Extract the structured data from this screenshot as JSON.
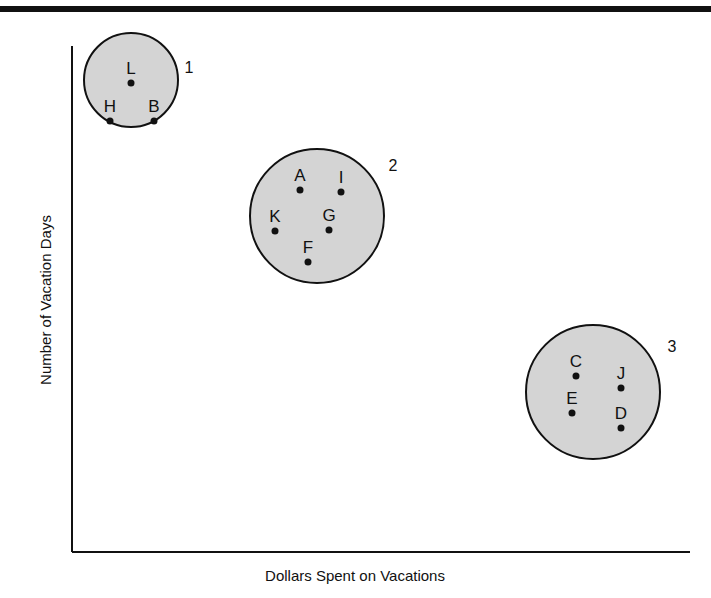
{
  "chart_data": {
    "type": "scatter",
    "title": "",
    "xlabel": "Dollars Spent on Vacations",
    "ylabel": "Number of Vacation Days",
    "grid": false,
    "legend": null,
    "clusters": [
      {
        "id": "1",
        "label": "1",
        "cx": 131,
        "cy": 80,
        "r": 47,
        "label_pos": [
          189,
          73
        ],
        "points": [
          {
            "name": "L",
            "x": 131,
            "y": 83
          },
          {
            "name": "H",
            "x": 110,
            "y": 121
          },
          {
            "name": "B",
            "x": 154,
            "y": 121
          }
        ]
      },
      {
        "id": "2",
        "label": "2",
        "cx": 317,
        "cy": 216,
        "r": 67,
        "label_pos": [
          393,
          171
        ],
        "points": [
          {
            "name": "A",
            "x": 300,
            "y": 190
          },
          {
            "name": "I",
            "x": 341,
            "y": 192
          },
          {
            "name": "K",
            "x": 275,
            "y": 231
          },
          {
            "name": "G",
            "x": 329,
            "y": 230
          },
          {
            "name": "F",
            "x": 308,
            "y": 262
          }
        ]
      },
      {
        "id": "3",
        "label": "3",
        "cx": 593,
        "cy": 392,
        "r": 67,
        "label_pos": [
          672,
          352
        ],
        "points": [
          {
            "name": "C",
            "x": 576,
            "y": 376
          },
          {
            "name": "J",
            "x": 621,
            "y": 388
          },
          {
            "name": "E",
            "x": 572,
            "y": 413
          },
          {
            "name": "D",
            "x": 621,
            "y": 428
          }
        ]
      }
    ]
  },
  "colors": {
    "cluster_fill": "#d4d4d4",
    "stroke": "#111111"
  }
}
